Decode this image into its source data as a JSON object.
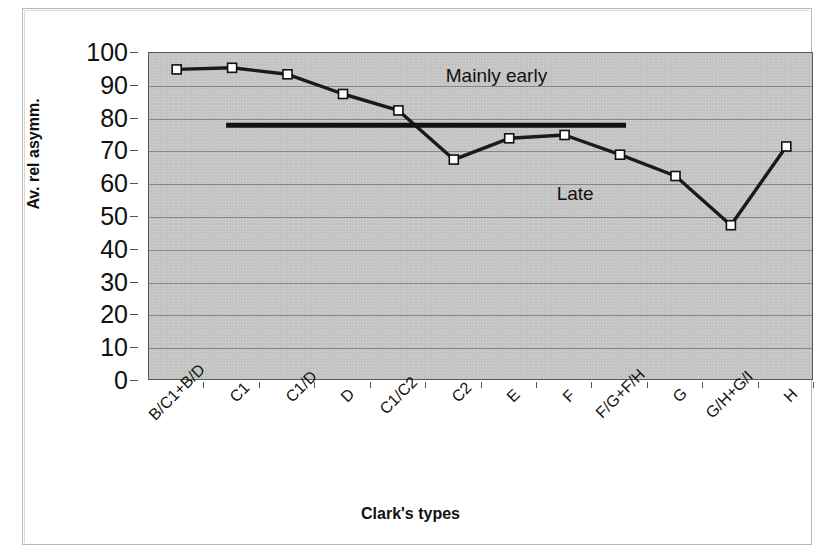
{
  "chart_data": {
    "type": "line",
    "title": "",
    "xlabel": "Clark's types",
    "ylabel": "Av. rel asymm.",
    "categories": [
      "B/C1+B/D",
      "C1",
      "C1/D",
      "D",
      "C1/C2",
      "C2",
      "E",
      "F",
      "F/G+F/H",
      "G",
      "G/H+G/I",
      "H"
    ],
    "values": [
      95,
      95.5,
      93.5,
      87.5,
      82.5,
      67.5,
      74,
      75,
      69,
      62.5,
      47.5,
      71.5
    ],
    "series": [
      {
        "name": "Av. rel asymm.",
        "values": [
          95,
          95.5,
          93.5,
          87.5,
          82.5,
          67.5,
          74,
          75,
          69,
          62.5,
          47.5,
          71.5
        ],
        "marker": "open-square",
        "line_color": "#1a1a1a"
      }
    ],
    "ylim": [
      0,
      100
    ],
    "yticks": [
      0,
      10,
      20,
      30,
      40,
      50,
      60,
      70,
      80,
      90,
      100
    ],
    "ytick_labels": [
      "0",
      "10",
      "20",
      "30",
      "40",
      "50",
      "60",
      "70",
      "80",
      "90",
      "100"
    ],
    "grid": "horizontal",
    "legend": "none",
    "plot_background": "#c3c3c3",
    "threshold_line": {
      "value": 78,
      "start_category": "C1",
      "end_category": "F/G+F/H",
      "color": "#111111",
      "width_px": 5
    },
    "annotations": [
      {
        "text": "Mainly early",
        "x_category": "C2",
        "y_value": 93
      },
      {
        "text": "Late",
        "x_category": "F",
        "y_value": 57
      }
    ]
  }
}
